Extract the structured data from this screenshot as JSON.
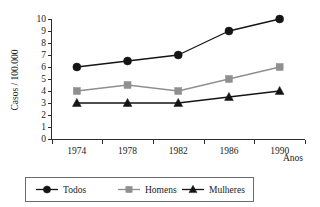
{
  "chart_data": {
    "type": "line",
    "title": "",
    "subtitle": "",
    "xlabel": "Anos",
    "ylabel": "Casos / 100.000",
    "categories": [
      "1974",
      "1978",
      "1982",
      "1986",
      "1990"
    ],
    "x": [
      1974,
      1978,
      1982,
      1986,
      1990
    ],
    "ylim": [
      0,
      10
    ],
    "yticks": [
      "0",
      "1",
      "2",
      "3",
      "4",
      "5",
      "6",
      "7",
      "8",
      "9",
      "10"
    ],
    "grid": false,
    "legend_position": "bottom",
    "series": [
      {
        "name": "Todos",
        "values": [
          6,
          6.5,
          7,
          9,
          10
        ],
        "color": "#151515",
        "marker": "circle",
        "marker_color": "#151515"
      },
      {
        "name": "Homens",
        "values": [
          4,
          4.5,
          4,
          5,
          6
        ],
        "color": "#8f8f8f",
        "marker": "square",
        "marker_color": "#8f8f8f"
      },
      {
        "name": "Mulheres",
        "values": [
          3,
          3,
          3,
          3.5,
          4
        ],
        "color": "#151515",
        "marker": "triangle",
        "marker_color": "#151515"
      }
    ]
  },
  "axes": {
    "y_title": "Casos / 100.000",
    "x_title": "Anos"
  },
  "legend": {
    "entries": [
      {
        "label": "Todos",
        "marker": "circle-marker",
        "color": "#151515"
      },
      {
        "label": "Homens",
        "marker": "square-marker",
        "color": "#8f8f8f"
      },
      {
        "label": "Mulheres",
        "marker": "triangle-marker",
        "color": "#151515"
      }
    ]
  }
}
